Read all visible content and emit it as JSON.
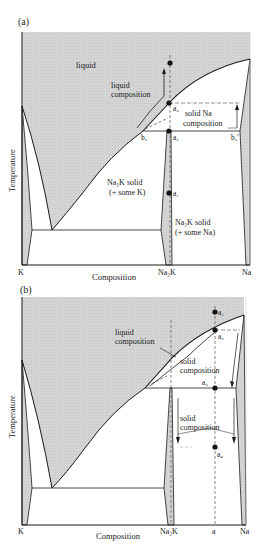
{
  "panels": [
    {
      "id": "a",
      "tag": "(a)",
      "ylabel": "Temperature",
      "xlabel": "Composition",
      "ticks": {
        "k": "K",
        "na2k": "Na₂K",
        "na": "Na"
      },
      "regions": {
        "liquid": "liquid",
        "na2k_some_k_1": "Na₂K solid",
        "na2k_some_k_2": "(+ some K)",
        "na2k_some_na_1": "Na₂K solid",
        "na2k_some_na_2": "(+ some Na)"
      },
      "annotations": {
        "liquid_comp_1": "liquid",
        "liquid_comp_2": "composition",
        "solid_na_1": "solid Na",
        "solid_na_2": "composition"
      },
      "points": {
        "a3": "a₃",
        "a2": "a₂",
        "a1": "a₁",
        "b2": "b₂",
        "b2p": "b₂′"
      }
    },
    {
      "id": "b",
      "tag": "(b)",
      "ylabel": "Temperature",
      "xlabel": "Composition",
      "ticks": {
        "k": "K",
        "na2k": "Na₂K",
        "a": "a",
        "na": "Na"
      },
      "annotations": {
        "liquid_comp_1": "liquid",
        "liquid_comp_2": "composition",
        "solid_comp_1": "solid",
        "solid_comp_2": "composition",
        "solid_comp2_1": "solid",
        "solid_comp2_2": "composition"
      },
      "points": {
        "a1": "a₁",
        "a2": "a₂",
        "a3": "a₃",
        "a4": "a₄"
      }
    }
  ],
  "colors": {
    "shade": "#d2d2d2",
    "line": "#1a1a1a",
    "dash": "#555555"
  }
}
